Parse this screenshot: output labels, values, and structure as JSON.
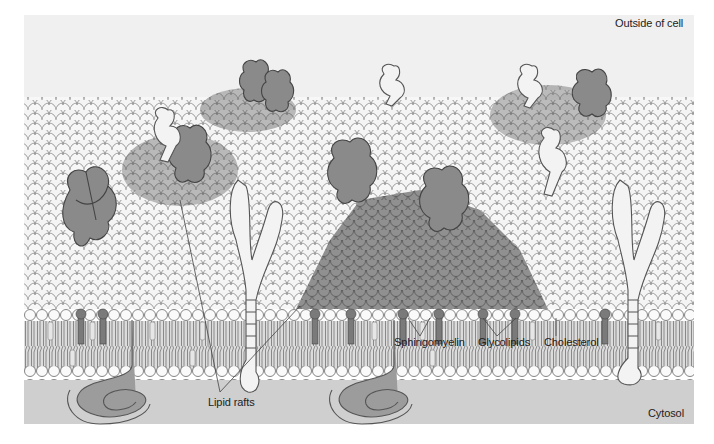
{
  "figure": {
    "regions": {
      "outside": "Outside of cell",
      "inside": "Cytosol"
    },
    "labels": {
      "sphingomyelin": "Sphingomyelin",
      "glycolipids": "Glycolipids",
      "cholesterol": "Cholesterol",
      "lipid_rafts": "Lipid rafts"
    },
    "colors": {
      "background": "#ffffff",
      "extracellular": "#f0f0f0",
      "cytosol": "#cfcfcf",
      "lipid_head_light": "#f7f7f7",
      "lipid_head_raft": "#8f8f8f",
      "raft_protein": "#8a8a8a",
      "non_raft_protein": "#f2f2f2",
      "outline": "#555555"
    }
  }
}
